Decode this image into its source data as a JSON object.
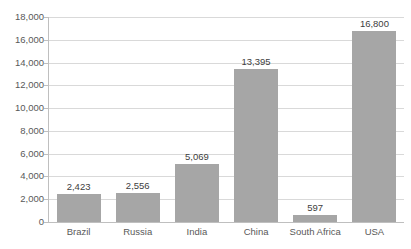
{
  "chart_data": {
    "type": "bar",
    "title": "",
    "subtitle": "",
    "xlabel": "",
    "ylabel": "",
    "categories": [
      "Brazil",
      "Russia",
      "India",
      "China",
      "South Africa",
      "USA"
    ],
    "values": [
      2423,
      2556,
      5069,
      13395,
      597,
      16800
    ],
    "value_labels": [
      "2,423",
      "2,556",
      "5,069",
      "13,395",
      "597",
      "16,800"
    ],
    "ylim": [
      0,
      18000
    ],
    "ytick_values": [
      0,
      2000,
      4000,
      6000,
      8000,
      10000,
      12000,
      14000,
      16000,
      18000
    ],
    "ytick_labels": [
      "0",
      "2,000",
      "4,000",
      "6,000",
      "8,000",
      "10,000",
      "12,000",
      "14,000",
      "16,000",
      "18,000"
    ],
    "grid": true,
    "legend": false,
    "legend_position": "none",
    "series": [
      {
        "name": "",
        "values": [
          2423,
          2556,
          5069,
          13395,
          597,
          16800
        ]
      }
    ],
    "colors": {
      "bar_fill": "#a6a6a6",
      "gridline": "#d9d9d9",
      "axis_line": "#bfbfbf",
      "tick_label": "#595959",
      "value_label": "#404040",
      "background": "#ffffff"
    }
  }
}
